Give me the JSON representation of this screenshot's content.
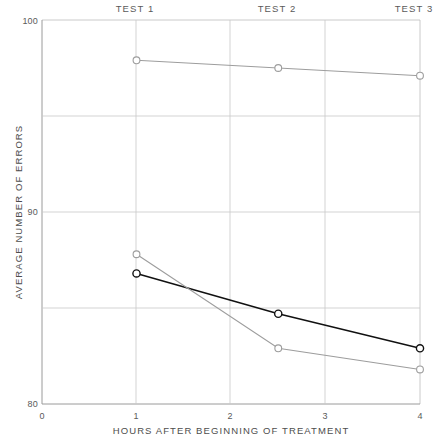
{
  "chart_data": {
    "type": "line",
    "title": "",
    "xlabel": "HOURS AFTER BEGINNING OF TREATMENT",
    "ylabel": "AVERAGE NUMBER OF ERRORS",
    "xlim": [
      0,
      4
    ],
    "ylim": [
      80,
      100
    ],
    "xticks": [
      0,
      1,
      2,
      3,
      4
    ],
    "xtick_labels": [
      "0",
      "1",
      "2",
      "3",
      "4"
    ],
    "yticks": [
      80,
      90,
      100
    ],
    "ytick_labels": [
      "80",
      "90",
      "100"
    ],
    "gridlines_y": [
      85,
      90,
      95
    ],
    "gridlines_x": [
      1,
      2,
      3
    ],
    "grid": true,
    "legend": "none",
    "annotations": [
      {
        "text": "TEST 1",
        "x": 1.0
      },
      {
        "text": "TEST 2",
        "x": 2.5
      },
      {
        "text": "TEST 3",
        "x": 4.0
      }
    ],
    "x": [
      1,
      2.5,
      4
    ],
    "series": [
      {
        "name": "upper",
        "color": "#9d9d9d",
        "values": [
          97.9,
          97.5,
          97.1
        ]
      },
      {
        "name": "middle-dark",
        "color": "#111111",
        "values": [
          86.8,
          84.7,
          82.9
        ]
      },
      {
        "name": "lower-grey",
        "color": "#9d9d9d",
        "values": [
          87.8,
          82.9,
          81.8
        ]
      }
    ]
  },
  "axis": {
    "x_label": "HOURS AFTER BEGINNING OF TREATMENT",
    "y_label": "AVERAGE NUMBER OF ERRORS",
    "x_ticks": [
      "0",
      "1",
      "2",
      "3",
      "4"
    ],
    "y_top": "100",
    "y_mid": "90",
    "y_bottom": "80"
  },
  "top_labels": {
    "test1": "TEST 1",
    "test2": "TEST 2",
    "test3": "TEST 3"
  },
  "colors": {
    "dark_series": "#111111",
    "grey_series": "#9d9d9d",
    "grid": "#c8c8c8",
    "axis": "#9a9a9a"
  }
}
